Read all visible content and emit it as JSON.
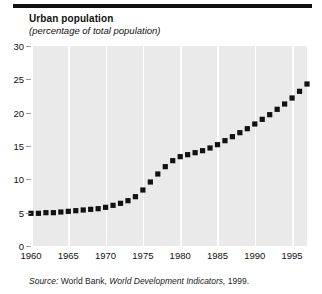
{
  "chart_data": {
    "type": "scatter",
    "title": "Urban population",
    "subtitle": "(percentage of total population)",
    "xlabel": "",
    "ylabel": "",
    "ylim": [
      0,
      30
    ],
    "xlim": [
      1960,
      1997
    ],
    "grid": "vertical-only",
    "legend": "none",
    "marker": "filled-square",
    "series_color": "#111111",
    "plot_background": "#eaeaea",
    "gridline_color": "#ffffff",
    "ytick_labels": [
      "0",
      "5",
      "10",
      "15",
      "20",
      "25",
      "30"
    ],
    "ytick_values": [
      0,
      5,
      10,
      15,
      20,
      25,
      30
    ],
    "xtick_labels": [
      "1960",
      "1965",
      "1970",
      "1975",
      "1980",
      "1985",
      "1990",
      "1995"
    ],
    "xtick_values": [
      1960,
      1965,
      1970,
      1975,
      1980,
      1985,
      1990,
      1995
    ],
    "x": [
      1960,
      1961,
      1962,
      1963,
      1964,
      1965,
      1966,
      1967,
      1968,
      1969,
      1970,
      1971,
      1972,
      1973,
      1974,
      1975,
      1976,
      1977,
      1978,
      1979,
      1980,
      1981,
      1982,
      1983,
      1984,
      1985,
      1986,
      1987,
      1988,
      1989,
      1990,
      1991,
      1992,
      1993,
      1994,
      1995,
      1996,
      1997
    ],
    "values": [
      4.9,
      4.9,
      5.0,
      5.0,
      5.1,
      5.2,
      5.3,
      5.4,
      5.5,
      5.6,
      5.8,
      6.1,
      6.4,
      6.8,
      7.4,
      8.4,
      9.6,
      10.8,
      11.9,
      12.8,
      13.4,
      13.7,
      14.0,
      14.3,
      14.7,
      15.2,
      15.8,
      16.4,
      17.0,
      17.6,
      18.3,
      19.0,
      19.7,
      20.5,
      21.3,
      22.2,
      23.2,
      24.3
    ]
  },
  "chart": {
    "title": "Urban population",
    "subtitle": "(percentage of total population)"
  },
  "source": {
    "lead": "Source:",
    "publisher": "World Bank,",
    "publication": "World Development Indicators,",
    "year": "1999."
  }
}
